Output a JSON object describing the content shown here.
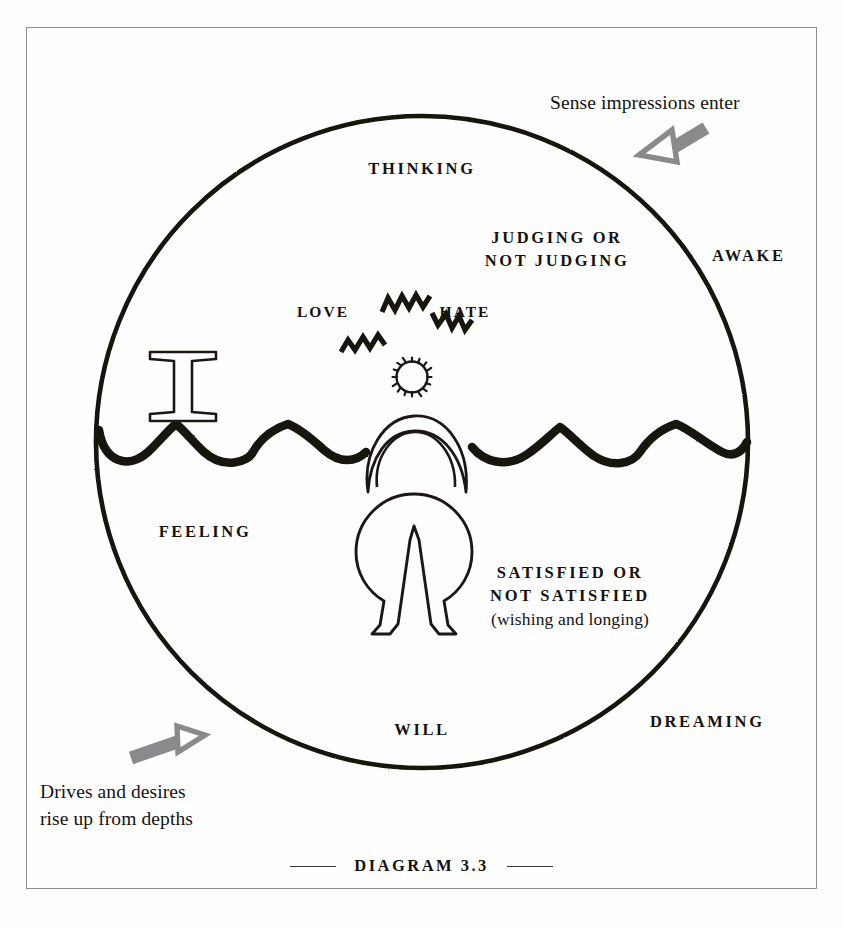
{
  "figure": {
    "caption": "DIAGRAM 3.3",
    "caption_rule_color": "#3a3a3c"
  },
  "colors": {
    "ink": "#14120f",
    "frame": "#8d8d90",
    "arrow_gray": "#8a8a8c",
    "paper": "#fefefe"
  },
  "annotations": {
    "top_right": "Sense impressions enter",
    "bottom_left_line1": "Drives and desires",
    "bottom_left_line2": "rise up from depths"
  },
  "circle_labels": {
    "thinking": "THINKING",
    "judging_line1": "JUDGING OR",
    "judging_line2": "NOT JUDGING",
    "love": "LOVE",
    "hate": "HATE",
    "feeling": "FEELING",
    "will": "WILL",
    "awake": "AWAKE",
    "dreaming": "DREAMING",
    "satisfied_line1": "SATISFIED OR",
    "satisfied_line2": "NOT SATISFIED",
    "satisfied_line3": "(wishing and longing)"
  },
  "glyphs": {
    "gemini": "gemini-symbol",
    "sun": "sun-head-symbol",
    "crescent": "crescent-arms-symbol",
    "body": "circle-body-symbol",
    "zigzags": "zigzag-emotion-marks"
  },
  "geometry": {
    "circle_center_x": 422,
    "circle_center_y": 442,
    "circle_radius": 326,
    "wave_y": 447
  }
}
